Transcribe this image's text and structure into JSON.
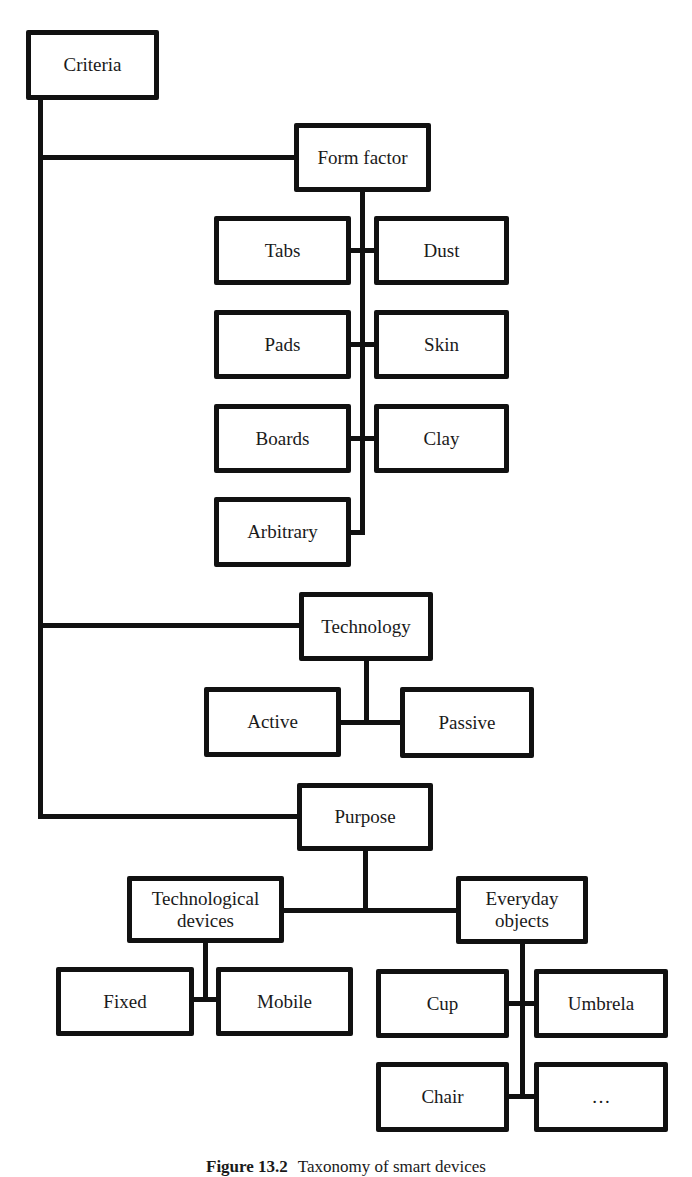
{
  "diagram": {
    "root": "Criteria",
    "form_factor": {
      "label": "Form factor",
      "children": [
        "Tabs",
        "Dust",
        "Pads",
        "Skin",
        "Boards",
        "Clay",
        "Arbitrary"
      ]
    },
    "technology": {
      "label": "Technology",
      "children": [
        "Active",
        "Passive"
      ]
    },
    "purpose": {
      "label": "Purpose",
      "technological_devices": {
        "label": "Technological devices",
        "children": [
          "Fixed",
          "Mobile"
        ]
      },
      "everyday_objects": {
        "label": "Everyday objects",
        "children": [
          "Cup",
          "Umbrela",
          "Chair",
          "…"
        ]
      }
    }
  },
  "caption": {
    "number": "Figure 13.2",
    "text": "Taxonomy of smart devices"
  }
}
